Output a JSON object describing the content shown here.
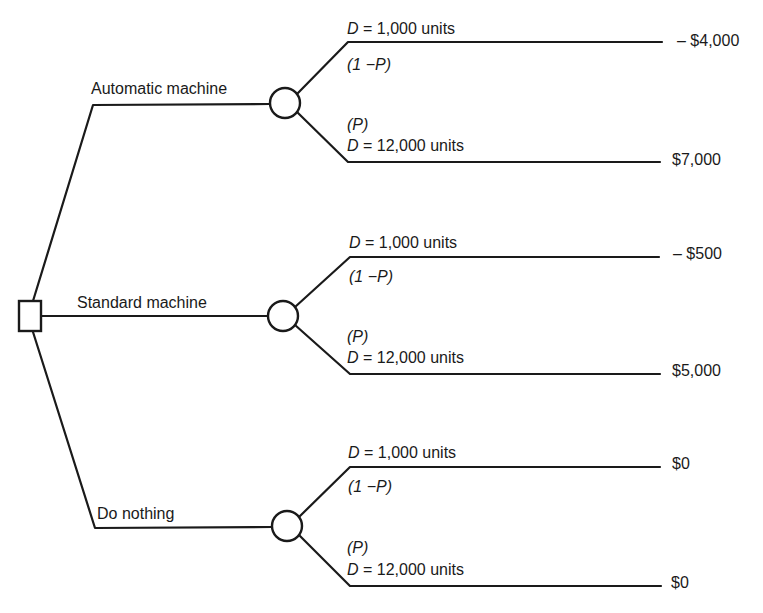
{
  "diagram": {
    "type": "decision-tree",
    "decision_node": {
      "shape": "square"
    },
    "alternatives": [
      {
        "label": "Automatic machine",
        "chance_node": {
          "shape": "circle"
        },
        "outcomes": [
          {
            "demand_var": "D",
            "demand_eq": "= 1,000 units",
            "prob_label": "(1 −P)",
            "payoff": "– $4,000"
          },
          {
            "demand_var": "D",
            "demand_eq": "= 12,000 units",
            "prob_label": "(P)",
            "payoff": "$7,000"
          }
        ]
      },
      {
        "label": "Standard machine",
        "chance_node": {
          "shape": "circle"
        },
        "outcomes": [
          {
            "demand_var": "D",
            "demand_eq": "= 1,000 units",
            "prob_label": "(1 −P)",
            "payoff": "– $500"
          },
          {
            "demand_var": "D",
            "demand_eq": "= 12,000 units",
            "prob_label": "(P)",
            "payoff": "$5,000"
          }
        ]
      },
      {
        "label": "Do nothing",
        "chance_node": {
          "shape": "circle"
        },
        "outcomes": [
          {
            "demand_var": "D",
            "demand_eq": "= 1,000 units",
            "prob_label": "(1 −P)",
            "payoff": "$0"
          },
          {
            "demand_var": "D",
            "demand_eq": "= 12,000 units",
            "prob_label": "(P)",
            "payoff": "$0"
          }
        ]
      }
    ]
  }
}
